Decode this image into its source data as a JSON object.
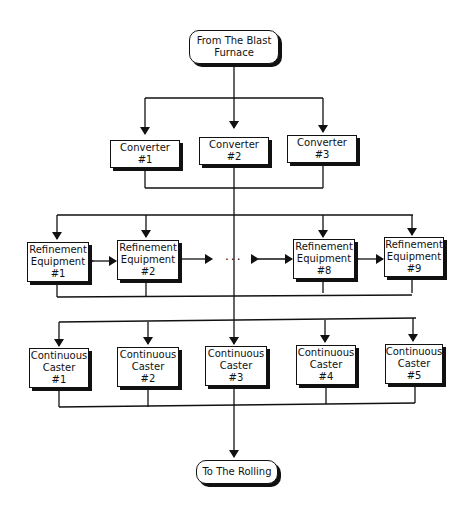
{
  "diagram": {
    "start": {
      "label": "From The Blast\nFurnace"
    },
    "end": {
      "label": "To The Rolling"
    },
    "converters": [
      {
        "label": "Converter\n#1"
      },
      {
        "label": "Converter\n#2"
      },
      {
        "label": "Converter\n#3"
      }
    ],
    "refinement": [
      {
        "label": "Refinement\nEquipment\n#1"
      },
      {
        "label": "Refinement\nEquipment\n#2"
      },
      {
        "label": "Refinement\nEquipment\n#8"
      },
      {
        "label": "Refinement\nEquipment\n#9"
      }
    ],
    "ellipsis": "...",
    "casters": [
      {
        "label": "Continuous\nCaster\n#1"
      },
      {
        "label": "Continuous\nCaster\n#2"
      },
      {
        "label": "Continuous\nCaster\n#3"
      },
      {
        "label": "Continuous\nCaster\n#4"
      },
      {
        "label": "Continuous\nCaster\n#5"
      }
    ]
  }
}
